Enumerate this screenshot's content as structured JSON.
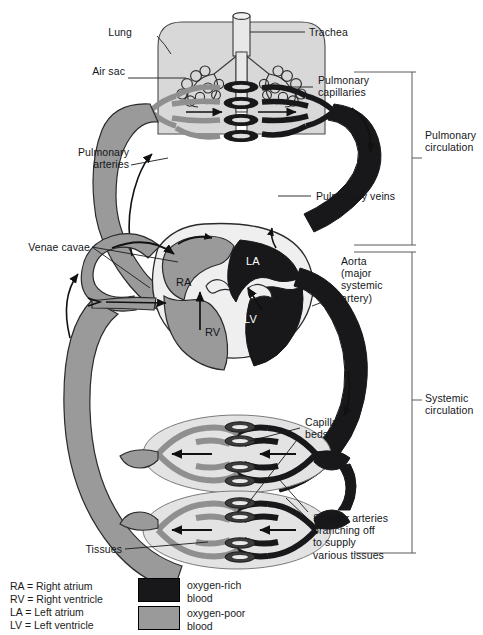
{
  "figure": {
    "colors": {
      "oxygen_rich": "#18181a",
      "oxygen_poor": "#9a9a9a",
      "lung_fill": "#d8d8d8",
      "tissue_fill": "#e3e3e3",
      "outline": "#1b1b1b",
      "background": "#ffffff"
    }
  },
  "labels": {
    "lung": "Lung",
    "trachea": "Trachea",
    "air_sac": "Air sac",
    "pulmonary_capillaries": "Pulmonary\ncapillaries",
    "pulmonary_arteries": "Pulmonary\narteries",
    "pulmonary_veins": "Pulmonary veins",
    "venae_cavae": "Venae cavae",
    "aorta": "Aorta\n(major\nsystemic\nartery)",
    "capillary_beds": "Capillary\nbeds",
    "smaller_arteries": "Smaller arteries\nbranching off\nto supply\nvarious tissues",
    "tissues": "Tissues"
  },
  "chambers": {
    "ra": "RA",
    "rv": "RV",
    "la": "LA",
    "lv": "LV"
  },
  "brackets": {
    "pulmonary": "Pulmonary\ncirculation",
    "systemic": "Systemic\ncirculation"
  },
  "legend": {
    "abbreviations": [
      "RA = Right atrium",
      "RV = Right ventricle",
      "LA = Left atrium",
      "LV = Left ventricle"
    ],
    "swatches": [
      {
        "label": "oxygen-rich\nblood",
        "color": "#18181a"
      },
      {
        "label": "oxygen-poor\nblood",
        "color": "#9a9a9a"
      }
    ]
  }
}
